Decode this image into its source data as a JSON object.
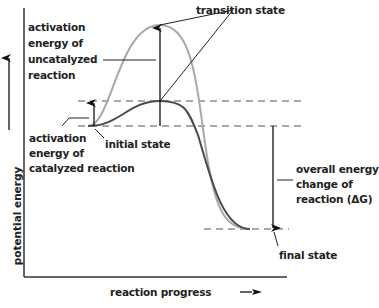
{
  "diagram": {
    "axes": {
      "x_label": "reaction progress",
      "y_label": "potential energy"
    },
    "labels": {
      "transition_state": "transition state",
      "uncatalyzed_activation": [
        "activation",
        "energy of",
        "uncatalyzed",
        "reaction"
      ],
      "catalyzed_activation": [
        "activation",
        "energy of",
        "catalyzed reaction"
      ],
      "initial_state": "initial state",
      "overall_energy_change": [
        "overall energy",
        "change of",
        "reaction (ΔG)"
      ],
      "final_state": "final state"
    },
    "curves": [
      {
        "name": "uncatalyzed",
        "color": "#a8a8a8"
      },
      {
        "name": "catalyzed",
        "color": "#4a4a4a"
      }
    ],
    "colors": {
      "axis": "#333333",
      "text": "#222222"
    }
  }
}
